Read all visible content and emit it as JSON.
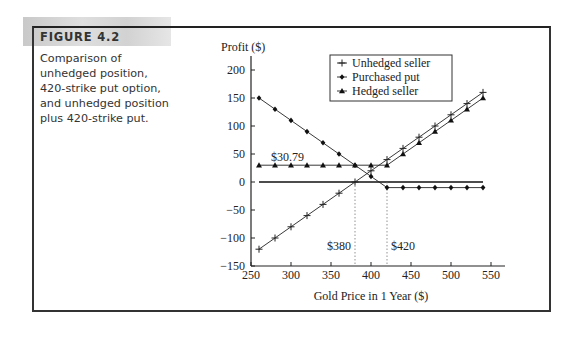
{
  "figure": {
    "label": "FIGURE 4.2",
    "caption_lines": [
      "Comparison of",
      "unhedged position,",
      "420-strike put option,",
      "and unhedged position",
      "plus 420-strike put."
    ]
  },
  "chart_data": {
    "type": "line",
    "title": "",
    "ylabel": "Profit ($)",
    "xlabel": "Gold Price in 1 Year ($)",
    "xlim": [
      250,
      550
    ],
    "ylim": [
      -150,
      225
    ],
    "xticks": [
      250,
      300,
      350,
      400,
      450,
      500,
      550
    ],
    "yticks": [
      -150,
      -100,
      -50,
      0,
      50,
      100,
      150,
      200
    ],
    "grid": false,
    "legend_position": "top-center",
    "x": [
      260,
      280,
      300,
      320,
      340,
      360,
      380,
      400,
      420,
      440,
      460,
      480,
      500,
      520,
      540
    ],
    "series": [
      {
        "name": "Unhedged seller",
        "marker": "plus",
        "values": [
          -120,
          -100,
          -80,
          -60,
          -40,
          -20,
          0,
          20,
          40,
          60,
          80,
          100,
          120,
          140,
          160
        ]
      },
      {
        "name": "Purchased put",
        "marker": "diamond",
        "values": [
          150,
          130,
          110,
          90,
          70,
          50,
          30,
          10,
          -10,
          -10,
          -10,
          -10,
          -10,
          -10,
          -10
        ]
      },
      {
        "name": "Hedged seller",
        "marker": "triangle",
        "values": [
          30,
          30,
          30,
          30,
          30,
          30,
          30,
          30,
          30,
          50,
          70,
          90,
          110,
          130,
          150
        ]
      }
    ],
    "zero_line": {
      "y": 0,
      "x_range": [
        260,
        540
      ]
    },
    "reference_lines": [
      {
        "x": 380,
        "label": "$380"
      },
      {
        "x": 420,
        "label": "$420"
      }
    ],
    "annotations": [
      {
        "text": "$30.79",
        "x": 300,
        "y": 45
      }
    ]
  }
}
